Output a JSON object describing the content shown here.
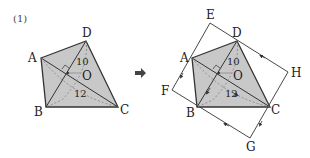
{
  "problem_label": "(1)",
  "left_figure": {
    "points": {
      "A": [
        41,
        58
      ],
      "B": [
        46,
        107
      ],
      "C": [
        118,
        107
      ],
      "D": [
        86,
        41
      ],
      "O": [
        68,
        73
      ]
    },
    "labels": {
      "A": "A",
      "B": "B",
      "C": "C",
      "D": "D",
      "O": "O"
    },
    "diagonal_BD": "10",
    "diagonal_AC": "12"
  },
  "arrow": {
    "symbol": "➡"
  },
  "right_figure": {
    "points": {
      "A": [
        192,
        58
      ],
      "B": [
        197,
        107
      ],
      "C": [
        270,
        107
      ],
      "D": [
        237,
        41
      ],
      "O": [
        219,
        73
      ],
      "E": [
        210,
        23
      ],
      "F": [
        172,
        90
      ],
      "G": [
        250,
        138
      ],
      "H": [
        288,
        72
      ]
    },
    "labels": {
      "A": "A",
      "B": "B",
      "C": "C",
      "D": "D",
      "O": "O",
      "E": "E",
      "F": "F",
      "G": "G",
      "H": "H"
    },
    "diagonal_BD": "10",
    "diagonal_AC": "12"
  },
  "colors": {
    "fill": "#c8c8c8",
    "stroke": "#333333",
    "dashed": "#777777"
  }
}
